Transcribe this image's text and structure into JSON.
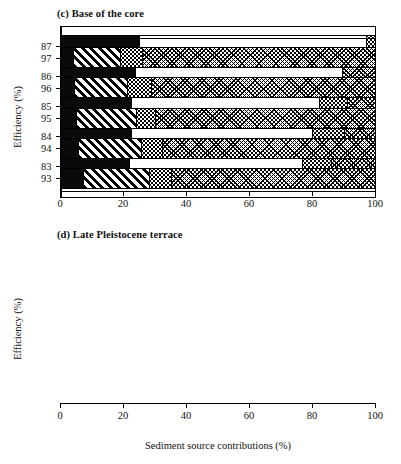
{
  "figure": {
    "xlabel": "Sediment source contributions (%)",
    "ylabel": "Efficiency (%)"
  },
  "panels": [
    {
      "id": "c",
      "title": "(c) Base of the core",
      "ylabel": "Efficiency (%)",
      "xlabel": "",
      "xticks": [
        "0",
        "20",
        "40",
        "60",
        "80",
        "100"
      ],
      "categories": [
        "87",
        "86",
        "85",
        "84",
        "83"
      ]
    },
    {
      "id": "d",
      "title": "(d) Late Pleistocene  terrace",
      "ylabel": "Efficiency (%)",
      "xlabel": "Sediment source contributions (%)",
      "xticks": [
        "0",
        "20",
        "40",
        "60",
        "80",
        "100"
      ],
      "categories": [
        "97",
        "96",
        "95",
        "94",
        "93"
      ]
    }
  ],
  "chart_data": [
    {
      "type": "bar",
      "orientation": "horizontal",
      "stacked": true,
      "title": "(c) Base of the core",
      "xlabel": "",
      "ylabel": "Efficiency (%)",
      "xlim": [
        0,
        100
      ],
      "xticks": [
        0,
        20,
        40,
        60,
        80,
        100
      ],
      "grid": false,
      "legend": "none",
      "categories": [
        "87",
        "86",
        "85",
        "84",
        "83"
      ],
      "series": [
        {
          "name": "source-1-black",
          "pattern": "solid-black",
          "values": [
            24.8,
            23.8,
            22.5,
            22.5,
            21.6
          ]
        },
        {
          "name": "source-2-white",
          "pattern": "white",
          "values": [
            72.7,
            66.0,
            60.0,
            57.8,
            55.5
          ]
        },
        {
          "name": "source-3-stipple",
          "pattern": "dots",
          "values": [
            2.5,
            0.0,
            8.9,
            10.2,
            9.2
          ]
        },
        {
          "name": "source-4-wave",
          "pattern": "wave-crosshatch",
          "values": [
            0.0,
            10.2,
            8.6,
            9.5,
            13.7
          ]
        }
      ]
    },
    {
      "type": "bar",
      "orientation": "horizontal",
      "stacked": true,
      "title": "(d) Late Pleistocene  terrace",
      "xlabel": "Sediment source contributions (%)",
      "ylabel": "Efficiency (%)",
      "xlim": [
        0,
        100
      ],
      "xticks": [
        0,
        20,
        40,
        60,
        80,
        100
      ],
      "grid": false,
      "legend": "none",
      "categories": [
        "97",
        "96",
        "95",
        "94",
        "93"
      ],
      "series": [
        {
          "name": "source-1-black",
          "pattern": "solid-black",
          "values": [
            3.8,
            4.1,
            4.8,
            5.4,
            7.0
          ]
        },
        {
          "name": "source-2-diagonal",
          "pattern": "diagonal-hatch",
          "values": [
            15.2,
            16.9,
            19.2,
            20.3,
            21.0
          ]
        },
        {
          "name": "source-3-stipple",
          "pattern": "dots",
          "values": [
            7.0,
            7.6,
            6.0,
            6.7,
            7.0
          ]
        },
        {
          "name": "source-4-wave",
          "pattern": "wave-crosshatch",
          "values": [
            74.0,
            71.4,
            70.0,
            67.6,
            65.0
          ]
        }
      ]
    }
  ]
}
